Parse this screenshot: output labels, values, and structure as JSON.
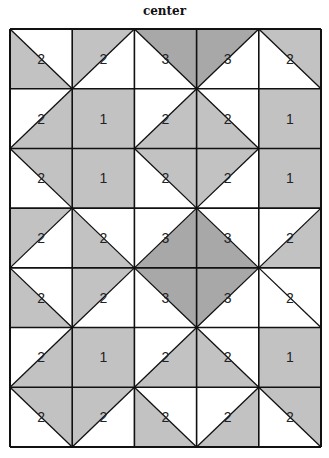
{
  "title": "center",
  "colors": {
    "light_gray": "#c2c2c2",
    "dark_gray": "#a8a8a8",
    "white": "#ffffff",
    "line": "#111111"
  },
  "grid": {
    "left": 10,
    "top": 29,
    "width": 311,
    "height": 418,
    "rows": 7,
    "cols": 5,
    "cells": [
      [
        {
          "label": "2",
          "diag": "\\",
          "shade": "bl",
          "tone": "light"
        },
        {
          "label": "2",
          "diag": "/",
          "shade": "tl",
          "tone": "light"
        },
        {
          "label": "3",
          "diag": "\\",
          "shade": "tr",
          "tone": "dark"
        },
        {
          "label": "3",
          "diag": "/",
          "shade": "tl",
          "tone": "dark"
        },
        {
          "label": "2",
          "diag": "\\",
          "shade": "tr",
          "tone": "light"
        }
      ],
      [
        {
          "label": "2",
          "diag": "/",
          "shade": "br",
          "tone": "light"
        },
        {
          "label": "1",
          "diag": "none",
          "shade": "full",
          "tone": "light"
        },
        {
          "label": "2",
          "diag": "/",
          "shade": "br",
          "tone": "light"
        },
        {
          "label": "2",
          "diag": "\\",
          "shade": "bl",
          "tone": "light"
        },
        {
          "label": "1",
          "diag": "none",
          "shade": "full",
          "tone": "light"
        }
      ],
      [
        {
          "label": "2",
          "diag": "\\",
          "shade": "tr",
          "tone": "light"
        },
        {
          "label": "1",
          "diag": "none",
          "shade": "full",
          "tone": "light"
        },
        {
          "label": "2",
          "diag": "\\",
          "shade": "tr",
          "tone": "light"
        },
        {
          "label": "2",
          "diag": "/",
          "shade": "tl",
          "tone": "light"
        },
        {
          "label": "1",
          "diag": "none",
          "shade": "full",
          "tone": "light"
        }
      ],
      [
        {
          "label": "2",
          "diag": "/",
          "shade": "tl",
          "tone": "light"
        },
        {
          "label": "2",
          "diag": "\\",
          "shade": "bl",
          "tone": "light"
        },
        {
          "label": "3",
          "diag": "/",
          "shade": "br",
          "tone": "dark"
        },
        {
          "label": "3",
          "diag": "\\",
          "shade": "bl",
          "tone": "dark"
        },
        {
          "label": "2",
          "diag": "/",
          "shade": "br",
          "tone": "light"
        }
      ],
      [
        {
          "label": "2",
          "diag": "\\",
          "shade": "bl",
          "tone": "light"
        },
        {
          "label": "2",
          "diag": "/",
          "shade": "tl",
          "tone": "light"
        },
        {
          "label": "3",
          "diag": "\\",
          "shade": "tr",
          "tone": "dark"
        },
        {
          "label": "3",
          "diag": "/",
          "shade": "tl",
          "tone": "dark"
        },
        {
          "label": "2",
          "diag": "\\",
          "shade": "none",
          "tone": "light"
        }
      ],
      [
        {
          "label": "2",
          "diag": "/",
          "shade": "br",
          "tone": "light"
        },
        {
          "label": "1",
          "diag": "none",
          "shade": "full",
          "tone": "light"
        },
        {
          "label": "2",
          "diag": "/",
          "shade": "br",
          "tone": "light"
        },
        {
          "label": "2",
          "diag": "\\",
          "shade": "bl",
          "tone": "light"
        },
        {
          "label": "1",
          "diag": "none",
          "shade": "full",
          "tone": "light"
        }
      ],
      [
        {
          "label": "2",
          "diag": "\\",
          "shade": "tr",
          "tone": "light"
        },
        {
          "label": "2",
          "diag": "/",
          "shade": "tl",
          "tone": "light"
        },
        {
          "label": "2",
          "diag": "\\",
          "shade": "bl",
          "tone": "light"
        },
        {
          "label": "2",
          "diag": "/",
          "shade": "br",
          "tone": "light"
        },
        {
          "label": "2",
          "diag": "\\",
          "shade": "tr",
          "tone": "light"
        }
      ]
    ]
  }
}
